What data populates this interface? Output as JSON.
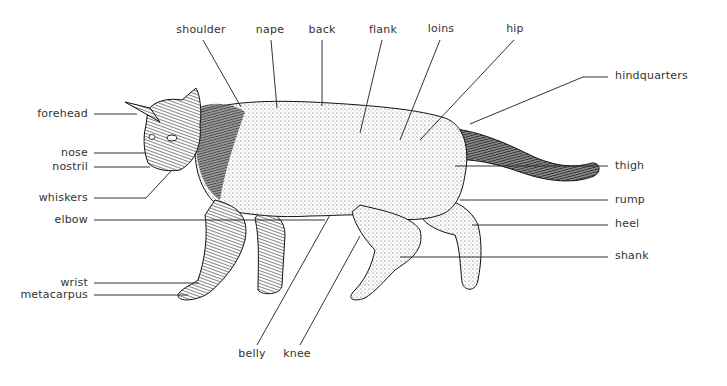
{
  "diagram": {
    "line_color": "#333333",
    "labels": {
      "forehead": "forehead",
      "nose": "nose",
      "nostril": "nostril",
      "whiskers": "whiskers",
      "elbow": "elbow",
      "wrist": "wrist",
      "metacarpus": "metacarpus",
      "shoulder": "shoulder",
      "nape": "nape",
      "back": "back",
      "flank": "flank",
      "loins": "loins",
      "hip": "hip",
      "hindquarters": "hindquarters",
      "thigh": "thigh",
      "rump": "rump",
      "heel": "heel",
      "shank": "shank",
      "belly": "belly",
      "knee": "knee"
    }
  }
}
